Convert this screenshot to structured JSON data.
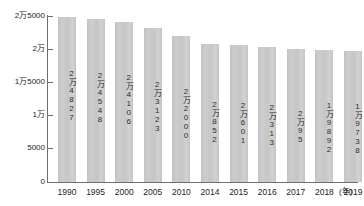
{
  "chart_data": {
    "type": "bar",
    "title": "",
    "xlabel": "年",
    "ylabel": "",
    "categories": [
      "1990",
      "1995",
      "2000",
      "2005",
      "2010",
      "2014",
      "2015",
      "2016",
      "2017",
      "2018",
      "2019"
    ],
    "values": [
      24827,
      24548,
      24106,
      23123,
      22000,
      20852,
      20601,
      20313,
      20095,
      19892,
      19738
    ],
    "value_labels": [
      "2万4827",
      "2万4548",
      "2万4106",
      "2万3123",
      "2万2000",
      "2万852",
      "2万601",
      "2万313",
      "2万95",
      "1万9892",
      "1万9738"
    ],
    "ylim": [
      0,
      25000
    ],
    "y_ticks": [
      0,
      5000,
      10000,
      15000,
      20000,
      25000
    ],
    "y_tick_labels": [
      "0",
      "5000",
      "1万",
      "1万5000",
      "2万",
      "2万5000"
    ],
    "grid": false,
    "legend": false,
    "bar_color": "#c9c9c9",
    "axis_color": "#6f6f6f",
    "text_color": "#1c1c1c"
  },
  "axis": {
    "unit_suffix": "(年)"
  }
}
